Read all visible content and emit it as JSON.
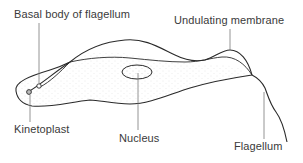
{
  "diagram": {
    "labels": {
      "basal_body": "Basal body of flagellum",
      "undulating_membrane": "Undulating membrane",
      "kinetoplast": "Kinetoplast",
      "nucleus": "Nucleus",
      "flagellum": "Flagellum"
    },
    "colors": {
      "outline": "#2a2a2a",
      "leader": "#7a7a7a",
      "text": "#3a3a3a",
      "stipple": "#cfcfcf"
    }
  }
}
